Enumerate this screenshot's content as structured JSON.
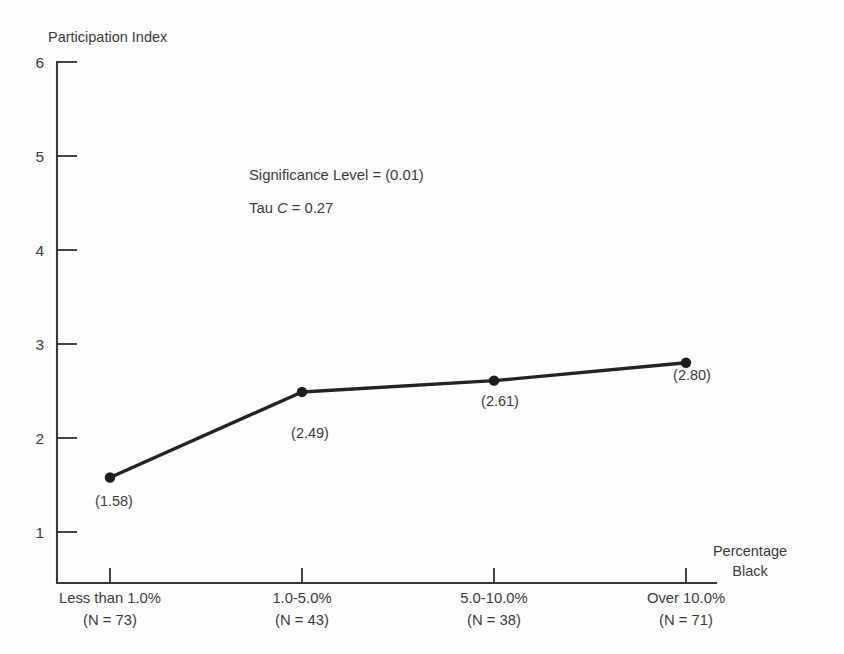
{
  "chart_data": {
    "type": "line",
    "title": "",
    "ylabel": "Participation Index",
    "xlabel": "Percentage Black",
    "xlabel_line1": "Percentage",
    "xlabel_line2": "Black",
    "categories": [
      "Less than 1.0%",
      "1.0-5.0%",
      "5.0-10.0%",
      "Over 10.0%"
    ],
    "category_sublabels": [
      "(N = 73)",
      "(N = 43)",
      "(N = 38)",
      "(N = 71)"
    ],
    "counts": [
      73,
      43,
      38,
      71
    ],
    "values": [
      1.58,
      2.49,
      2.61,
      2.8
    ],
    "point_labels": [
      "(1.58)",
      "(2.49)",
      "(2.61)",
      "(2.80)"
    ],
    "ylim": [
      0,
      6
    ],
    "ytick_values": [
      6,
      5,
      4,
      3,
      2,
      1
    ],
    "ytick_labels": [
      "6",
      "5",
      "4",
      "3",
      "2",
      "1"
    ],
    "grid": false,
    "legend": null,
    "annotations": [
      {
        "id": "significance",
        "prefix": "Significance Level = ",
        "value": "(0.01)",
        "text": "Significance Level = (0.01)"
      },
      {
        "id": "tau",
        "prefix": "Tau ",
        "symbol": "C",
        "suffix": " = 0.27",
        "text": "Tau C = 0.27"
      }
    ],
    "colors": {
      "line": "#232323",
      "marker": "#1d1d1d",
      "axis": "#39393b",
      "text": "#3a3a3a",
      "background": "#fefefe"
    }
  }
}
